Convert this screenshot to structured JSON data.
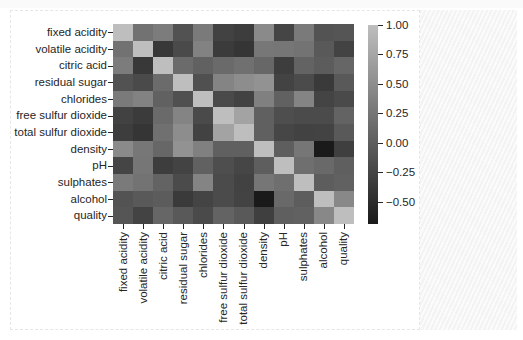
{
  "chart_data": {
    "type": "heatmap",
    "title": "",
    "labels": [
      "fixed acidity",
      "volatile acidity",
      "citric acid",
      "residual sugar",
      "chlorides",
      "free sulfur dioxide",
      "total sulfur dioxide",
      "density",
      "pH",
      "sulphates",
      "alcohol",
      "quality"
    ],
    "matrix": [
      [
        1.0,
        0.22,
        0.32,
        -0.11,
        0.3,
        -0.28,
        -0.33,
        0.46,
        -0.25,
        0.3,
        -0.1,
        -0.08
      ],
      [
        0.22,
        1.0,
        -0.38,
        -0.2,
        0.38,
        -0.35,
        -0.41,
        0.27,
        0.26,
        0.23,
        -0.04,
        -0.27
      ],
      [
        0.32,
        -0.38,
        1.0,
        0.14,
        0.04,
        0.13,
        0.2,
        0.1,
        -0.33,
        0.06,
        -0.01,
        0.09
      ],
      [
        -0.11,
        -0.2,
        0.14,
        1.0,
        -0.13,
        0.4,
        0.5,
        0.55,
        -0.27,
        -0.19,
        -0.36,
        -0.04
      ],
      [
        0.3,
        0.38,
        0.04,
        -0.13,
        1.0,
        -0.2,
        -0.28,
        0.36,
        0.04,
        0.4,
        -0.26,
        -0.2
      ],
      [
        -0.28,
        -0.35,
        0.13,
        0.4,
        -0.2,
        1.0,
        0.72,
        0.03,
        -0.15,
        -0.19,
        -0.18,
        0.06
      ],
      [
        -0.33,
        -0.41,
        0.2,
        0.5,
        -0.28,
        0.72,
        1.0,
        0.03,
        -0.24,
        -0.28,
        -0.27,
        -0.04
      ],
      [
        0.46,
        0.27,
        0.1,
        0.55,
        0.36,
        0.03,
        0.03,
        1.0,
        0.01,
        0.26,
        -0.69,
        -0.31
      ],
      [
        -0.25,
        0.26,
        -0.33,
        -0.27,
        0.04,
        -0.15,
        -0.24,
        0.01,
        1.0,
        0.19,
        0.12,
        0.02
      ],
      [
        0.3,
        0.23,
        0.06,
        -0.19,
        0.4,
        -0.19,
        -0.28,
        0.26,
        0.19,
        1.0,
        -0.0,
        0.04
      ],
      [
        -0.1,
        -0.04,
        -0.01,
        -0.36,
        -0.26,
        -0.18,
        -0.27,
        -0.69,
        0.12,
        -0.0,
        1.0,
        0.44
      ],
      [
        -0.08,
        -0.27,
        0.09,
        -0.04,
        -0.2,
        0.06,
        -0.04,
        -0.31,
        0.02,
        0.04,
        0.44,
        1.0
      ]
    ],
    "colorbar": {
      "min": -0.69,
      "max": 1.0,
      "ticks": [
        1.0,
        0.75,
        0.5,
        0.25,
        0.0,
        -0.25,
        -0.5
      ],
      "tick_labels": [
        "1.00",
        "0.75",
        "0.50",
        "0.25",
        "0.00",
        "−0.25",
        "−0.50"
      ],
      "color_low": "#1a1a1a",
      "color_high": "#bebebe"
    },
    "xlabel": "",
    "ylabel": "",
    "grid": false,
    "legend_position": "right (colorbar)"
  }
}
